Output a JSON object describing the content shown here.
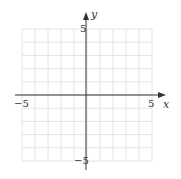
{
  "chart_data": {
    "type": "scatter",
    "title": "",
    "xlabel": "x",
    "ylabel": "y",
    "xlim": [
      -5,
      5
    ],
    "ylim": [
      -5,
      5
    ],
    "grid": true,
    "grid_step": 1,
    "x_tick_labels": [
      "-5",
      "5"
    ],
    "y_tick_labels": [
      "5",
      "-5"
    ],
    "series": []
  },
  "labels": {
    "x_axis": "x",
    "y_axis": "y",
    "x_min": "−5",
    "x_max": "5",
    "y_max": "5",
    "y_min": "−5"
  },
  "colors": {
    "grid": "#e4e4e4",
    "axis": "#333333"
  }
}
